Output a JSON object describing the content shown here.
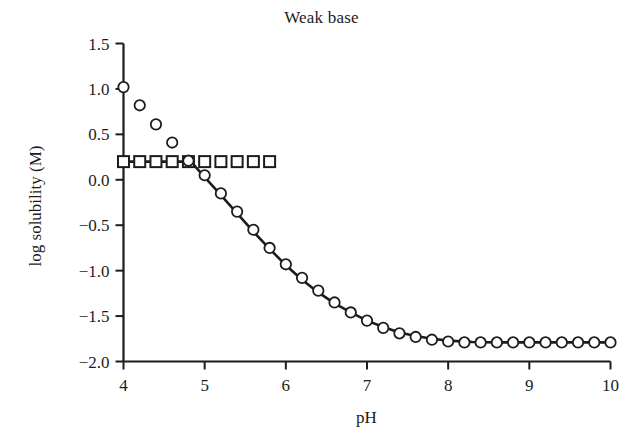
{
  "chart_data": {
    "type": "scatter",
    "title": "Weak base",
    "xlabel": "pH",
    "ylabel": "log solubility (M)",
    "xlim": [
      4,
      10
    ],
    "ylim": [
      -2.0,
      1.5
    ],
    "grid": false,
    "legend": null,
    "xticks": [
      "4",
      "5",
      "6",
      "7",
      "8",
      "9",
      "10"
    ],
    "xtick_values": [
      4,
      5,
      6,
      7,
      8,
      9,
      10
    ],
    "yticks": [
      "1.5",
      "1.0",
      "0.5",
      "0.0",
      "−0.5",
      "−1.0",
      "−1.5",
      "−2.0"
    ],
    "ytick_values": [
      1.5,
      1.0,
      0.5,
      0.0,
      -0.5,
      -1.0,
      -1.5,
      -2.0
    ],
    "series": [
      {
        "name": "circles",
        "marker": "open-circle",
        "x": [
          4.0,
          4.2,
          4.4,
          4.6,
          4.8,
          5.0,
          5.2,
          5.4,
          5.6,
          5.8,
          6.0,
          6.2,
          6.4,
          6.6,
          6.8,
          7.0,
          7.2,
          7.4,
          7.6,
          7.8,
          8.0,
          8.2,
          8.4,
          8.6,
          8.8,
          9.0,
          9.2,
          9.4,
          9.6,
          9.8,
          10.0
        ],
        "values": [
          1.02,
          0.82,
          0.61,
          0.41,
          0.21,
          0.05,
          -0.15,
          -0.35,
          -0.55,
          -0.75,
          -0.93,
          -1.08,
          -1.22,
          -1.35,
          -1.46,
          -1.55,
          -1.63,
          -1.69,
          -1.73,
          -1.76,
          -1.78,
          -1.79,
          -1.79,
          -1.79,
          -1.79,
          -1.79,
          -1.79,
          -1.79,
          -1.79,
          -1.79,
          -1.79
        ]
      },
      {
        "name": "squares",
        "marker": "open-square",
        "x": [
          4.0,
          4.2,
          4.4,
          4.6,
          4.8,
          5.0,
          5.2,
          5.4,
          5.6,
          5.8
        ],
        "values": [
          0.2,
          0.2,
          0.2,
          0.2,
          0.2,
          0.2,
          0.2,
          0.2,
          0.2,
          0.2
        ]
      },
      {
        "name": "model-line",
        "marker": "solid-line",
        "x": [
          4.0,
          4.2,
          4.4,
          4.6,
          4.83,
          5.0,
          5.2,
          5.4,
          5.6,
          5.8,
          6.0,
          6.2,
          6.4,
          6.6,
          6.8,
          7.0,
          7.2,
          7.4,
          7.6,
          7.8,
          8.0,
          8.3,
          8.6,
          9.0,
          9.4,
          9.7,
          10.0
        ],
        "values": [
          0.2,
          0.2,
          0.2,
          0.2,
          0.2,
          0.03,
          -0.17,
          -0.37,
          -0.57,
          -0.76,
          -0.94,
          -1.1,
          -1.24,
          -1.36,
          -1.46,
          -1.55,
          -1.62,
          -1.68,
          -1.72,
          -1.75,
          -1.77,
          -1.785,
          -1.79,
          -1.79,
          -1.79,
          -1.79,
          -1.79
        ]
      }
    ]
  },
  "axes": {
    "title": "Weak base",
    "x_axis_label": "pH",
    "y_axis_label": "log solubility (M)"
  }
}
